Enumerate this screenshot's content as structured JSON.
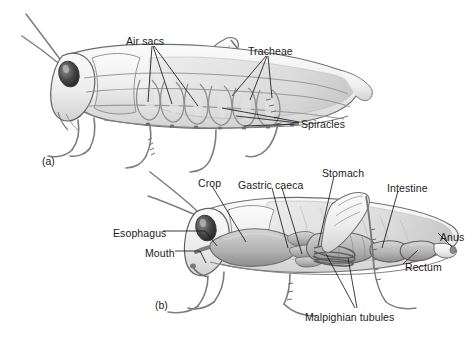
{
  "figure": {
    "background_color": "#ffffff",
    "ink_color": "#1a1a1a",
    "body_fill": "#f2f2f2",
    "body_shade": "#c9c9c9",
    "body_dark": "#8a8a8a",
    "organ_shade": "#b5b5b5",
    "organ_dark": "#707070",
    "eye_color": "#3a3a3a"
  },
  "panels": [
    {
      "id": "panel-a",
      "panel_label": "(a)",
      "subject": "grasshopper-respiratory-system",
      "labels": [
        {
          "name": "air-sacs",
          "text": "Air sacs",
          "x": 126,
          "y": 36,
          "leaders": 3
        },
        {
          "name": "tracheae",
          "text": "Tracheae",
          "x": 248,
          "y": 46,
          "leaders": 3
        },
        {
          "name": "spiracles",
          "text": "Spiracles",
          "x": 301,
          "y": 119,
          "leaders": 3
        }
      ]
    },
    {
      "id": "panel-b",
      "panel_label": "(b)",
      "subject": "grasshopper-digestive-system",
      "labels": [
        {
          "name": "crop",
          "text": "Crop",
          "x": 198,
          "y": 178,
          "leaders": 1
        },
        {
          "name": "gastric-caeca",
          "text": "Gastric caeca",
          "x": 238,
          "y": 180,
          "leaders": 2
        },
        {
          "name": "stomach",
          "text": "Stomach",
          "x": 322,
          "y": 168,
          "leaders": 1
        },
        {
          "name": "intestine",
          "text": "Intestine",
          "x": 387,
          "y": 183,
          "leaders": 1
        },
        {
          "name": "esophagus",
          "text": "Esophagus",
          "x": 113,
          "y": 234,
          "leaders": 1
        },
        {
          "name": "mouth",
          "text": "Mouth",
          "x": 145,
          "y": 254,
          "leaders": 1
        },
        {
          "name": "anus",
          "text": "Anus",
          "x": 440,
          "y": 236,
          "leaders": 1
        },
        {
          "name": "rectum",
          "text": "Rectum",
          "x": 405,
          "y": 267,
          "leaders": 1
        },
        {
          "name": "malpighian-tubules",
          "text": "Malpighian tubules",
          "x": 305,
          "y": 316,
          "leaders": 2
        }
      ]
    }
  ]
}
